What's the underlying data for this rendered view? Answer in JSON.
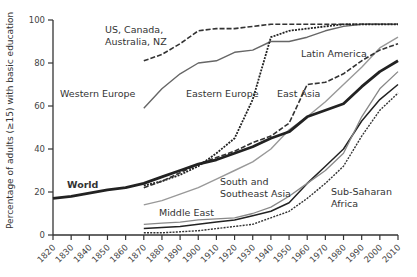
{
  "chart_data": {
    "type": "line",
    "title": "",
    "xlabel": "",
    "ylabel": "Percentage of adults (≥15) with basic education",
    "ylim": [
      0,
      100
    ],
    "xlim": [
      1820,
      2010
    ],
    "grid": false,
    "y_ticks": [
      0,
      20,
      40,
      60,
      80,
      100
    ],
    "x_ticks": [
      1820,
      1830,
      1840,
      1850,
      1860,
      1870,
      1880,
      1890,
      1900,
      1910,
      1920,
      1930,
      1940,
      1950,
      1960,
      1970,
      1980,
      1990,
      2000,
      2010
    ],
    "series": [
      {
        "name": "US, Canada, Australia, NZ",
        "style": "dashed",
        "color": "#333333",
        "width": 1.6,
        "x": [
          1870,
          1880,
          1890,
          1900,
          1910,
          1920,
          1930,
          1940,
          1950,
          1960,
          1970,
          1980,
          1990,
          2000,
          2010
        ],
        "values": [
          81,
          84,
          89,
          95,
          96,
          96,
          97,
          98,
          98,
          98,
          98,
          98,
          98,
          98,
          98
        ]
      },
      {
        "name": "Western Europe",
        "style": "solid",
        "color": "#666666",
        "width": 1.4,
        "x": [
          1870,
          1880,
          1890,
          1900,
          1910,
          1920,
          1930,
          1940,
          1950,
          1960,
          1970,
          1980,
          1990,
          2000,
          2010
        ],
        "values": [
          59,
          68,
          75,
          80,
          81,
          85,
          86,
          90,
          90,
          92,
          95,
          97,
          98,
          98,
          98
        ]
      },
      {
        "name": "Eastern Europe",
        "style": "dotted",
        "color": "#222222",
        "width": 1.8,
        "x": [
          1870,
          1880,
          1890,
          1900,
          1910,
          1920,
          1930,
          1940,
          1950,
          1960,
          1970,
          1980,
          1990,
          2000,
          2010
        ],
        "values": [
          23,
          25,
          28,
          32,
          38,
          45,
          63,
          92,
          95,
          96,
          97,
          98,
          98,
          98,
          98
        ]
      },
      {
        "name": "Latin America",
        "style": "solid",
        "color": "#999999",
        "width": 1.4,
        "x": [
          1870,
          1880,
          1890,
          1900,
          1910,
          1920,
          1930,
          1940,
          1950,
          1960,
          1970,
          1980,
          1990,
          2000,
          2010
        ],
        "values": [
          14,
          16,
          19,
          22,
          26,
          30,
          34,
          40,
          49,
          55,
          62,
          70,
          78,
          87,
          92
        ]
      },
      {
        "name": "East Asia",
        "style": "dashed",
        "color": "#333333",
        "width": 1.6,
        "x": [
          1870,
          1880,
          1890,
          1900,
          1910,
          1920,
          1930,
          1940,
          1950,
          1960,
          1970,
          1980,
          1990,
          2000,
          2010
        ],
        "values": [
          22,
          25,
          29,
          33,
          36,
          39,
          43,
          46,
          52,
          70,
          71,
          75,
          81,
          86,
          89
        ]
      },
      {
        "name": "World",
        "style": "solid",
        "color": "#222222",
        "width": 2.8,
        "x": [
          1820,
          1830,
          1840,
          1850,
          1860,
          1870,
          1880,
          1890,
          1900,
          1910,
          1920,
          1930,
          1940,
          1950,
          1960,
          1970,
          1980,
          1990,
          2000,
          2010
        ],
        "values": [
          17,
          18,
          19.5,
          21,
          22,
          24,
          27,
          30,
          33,
          35,
          38,
          41,
          45,
          48,
          55,
          58,
          61,
          69,
          76,
          81
        ]
      },
      {
        "name": "South and Southeast Asia",
        "style": "solid",
        "color": "#222222",
        "width": 1.5,
        "x": [
          1870,
          1880,
          1890,
          1900,
          1910,
          1920,
          1930,
          1940,
          1950,
          1960,
          1970,
          1980,
          1990,
          2000,
          2010
        ],
        "values": [
          3,
          3.5,
          4,
          5,
          6,
          7,
          9,
          11,
          15,
          24,
          32,
          40,
          53,
          63,
          70
        ]
      },
      {
        "name": "Middle East",
        "style": "solid",
        "color": "#888888",
        "width": 1.3,
        "x": [
          1870,
          1880,
          1890,
          1900,
          1910,
          1920,
          1930,
          1940,
          1950,
          1960,
          1970,
          1980,
          1990,
          2000,
          2010
        ],
        "values": [
          5,
          5.5,
          6,
          7,
          7.5,
          8,
          10,
          13,
          18,
          24,
          30,
          38,
          55,
          68,
          76
        ]
      },
      {
        "name": "Sub-Saharan Africa",
        "style": "dotted",
        "color": "#333333",
        "width": 1.4,
        "x": [
          1870,
          1880,
          1890,
          1900,
          1910,
          1920,
          1930,
          1940,
          1950,
          1960,
          1970,
          1980,
          1990,
          2000,
          2010
        ],
        "values": [
          1,
          1,
          1.5,
          2,
          3,
          4,
          5,
          8,
          11,
          17,
          24,
          32,
          46,
          58,
          66
        ]
      }
    ],
    "annotations": [
      {
        "text": "US, Canada,",
        "x": 105,
        "y": 33
      },
      {
        "text": "Australia, NZ",
        "x": 105,
        "y": 45
      },
      {
        "text": "Western Europe",
        "x": 60,
        "y": 97
      },
      {
        "text": "Eastern Europe",
        "x": 186,
        "y": 97
      },
      {
        "text": "Latin America",
        "x": 301,
        "y": 57
      },
      {
        "text": "East Asia",
        "x": 277,
        "y": 97
      },
      {
        "text": "South and",
        "x": 220,
        "y": 185
      },
      {
        "text": "Southeast Asia",
        "x": 220,
        "y": 197
      },
      {
        "text": "Middle East",
        "x": 159,
        "y": 216
      },
      {
        "text": "Sub-Saharan",
        "x": 331,
        "y": 195
      },
      {
        "text": "Africa",
        "x": 331,
        "y": 207
      }
    ],
    "world_label": {
      "text": "World",
      "x": 67,
      "y": 188
    }
  }
}
